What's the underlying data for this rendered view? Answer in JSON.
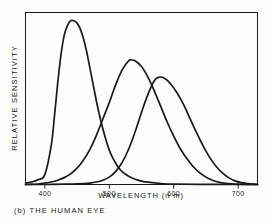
{
  "figure": {
    "caption": "(b) THE HUMAN EYE",
    "background_color": "#fdfdfc",
    "ink_color": "#1a1a1a"
  },
  "chart_data": {
    "type": "line",
    "title": "",
    "xlabel": "WAVELENGTH (n m)",
    "ylabel": "RELATIVE SENSITIVITY",
    "xlim": [
      370,
      730
    ],
    "ylim": [
      0,
      1.05
    ],
    "xticks": [
      400,
      500,
      600,
      700
    ],
    "xtick_labels": [
      "400",
      "500",
      "600",
      "700"
    ],
    "yticks": [],
    "ytick_labels": [],
    "grid": false,
    "legend": false,
    "frame": true,
    "line_color": "#1a1a1a",
    "series": [
      {
        "name": "short-wavelength cone",
        "peak_x": 445,
        "peak_y": 1.0,
        "x": [
          370,
          380,
          390,
          400,
          410,
          415,
          420,
          425,
          430,
          435,
          440,
          445,
          450,
          455,
          460,
          465,
          470,
          475,
          480,
          485,
          490,
          495,
          500,
          505,
          510,
          515,
          520,
          530,
          540,
          550,
          560,
          580,
          600,
          640,
          700,
          730
        ],
        "values": [
          0.01,
          0.015,
          0.03,
          0.06,
          0.24,
          0.42,
          0.62,
          0.79,
          0.91,
          0.97,
          1.0,
          1.0,
          0.985,
          0.95,
          0.89,
          0.81,
          0.71,
          0.61,
          0.51,
          0.42,
          0.34,
          0.27,
          0.21,
          0.165,
          0.13,
          0.1,
          0.078,
          0.05,
          0.032,
          0.021,
          0.014,
          0.006,
          0.003,
          0.001,
          0.0,
          0.0
        ]
      },
      {
        "name": "medium-wavelength cone",
        "peak_x": 535,
        "peak_y": 0.76,
        "x": [
          370,
          390,
          400,
          410,
          420,
          430,
          440,
          450,
          460,
          470,
          480,
          490,
          500,
          510,
          520,
          530,
          535,
          540,
          550,
          560,
          570,
          580,
          590,
          600,
          610,
          620,
          630,
          640,
          650,
          660,
          670,
          690,
          730
        ],
        "values": [
          0.0,
          0.003,
          0.008,
          0.015,
          0.026,
          0.042,
          0.065,
          0.1,
          0.15,
          0.215,
          0.3,
          0.4,
          0.5,
          0.61,
          0.7,
          0.755,
          0.76,
          0.755,
          0.72,
          0.655,
          0.57,
          0.475,
          0.38,
          0.295,
          0.22,
          0.16,
          0.11,
          0.072,
          0.045,
          0.026,
          0.014,
          0.004,
          0.0
        ]
      },
      {
        "name": "long-wavelength cone",
        "peak_x": 577,
        "peak_y": 0.655,
        "x": [
          370,
          400,
          430,
          450,
          470,
          480,
          490,
          500,
          510,
          520,
          530,
          540,
          550,
          560,
          570,
          577,
          585,
          595,
          605,
          615,
          625,
          635,
          645,
          655,
          665,
          675,
          685,
          695,
          705,
          715,
          730
        ],
        "values": [
          0.0,
          0.0,
          0.002,
          0.004,
          0.009,
          0.015,
          0.026,
          0.045,
          0.08,
          0.135,
          0.215,
          0.32,
          0.44,
          0.55,
          0.635,
          0.655,
          0.65,
          0.615,
          0.56,
          0.49,
          0.405,
          0.32,
          0.24,
          0.17,
          0.115,
          0.072,
          0.042,
          0.022,
          0.011,
          0.005,
          0.0
        ]
      }
    ]
  }
}
